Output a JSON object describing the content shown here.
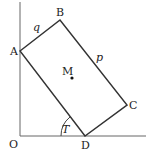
{
  "diagram": {
    "title": "",
    "points": {
      "O": {
        "label": "O",
        "x": 20,
        "y": 136
      },
      "A": {
        "label": "A",
        "x": 20,
        "y": 51
      },
      "B": {
        "label": "B",
        "x": 60,
        "y": 20
      },
      "C": {
        "label": "C",
        "x": 127,
        "y": 105
      },
      "D": {
        "label": "D",
        "x": 85,
        "y": 136
      },
      "M": {
        "label": "M",
        "x": 72,
        "y": 78
      }
    },
    "side_labels": {
      "AB": "q",
      "BC": "p"
    },
    "angle_label": "T",
    "colors": {
      "line": "#333333",
      "text": "#222222"
    }
  }
}
